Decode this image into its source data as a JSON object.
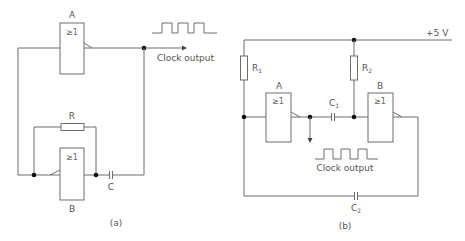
{
  "diagram_a": {
    "caption": "(a)",
    "gate_a": {
      "name": "A",
      "symbol": "≥1"
    },
    "gate_b": {
      "name": "B",
      "symbol": "≥1"
    },
    "resistor": {
      "label": "R"
    },
    "capacitor": {
      "label": "C"
    },
    "output_label": "Clock output"
  },
  "diagram_b": {
    "caption": "(b)",
    "supply_label": "+5 V",
    "gate_a": {
      "name": "A",
      "symbol": "≥1"
    },
    "gate_b": {
      "name": "B",
      "symbol": "≥1"
    },
    "r1": {
      "label": "R",
      "sub": "1"
    },
    "r2": {
      "label": "R",
      "sub": "2"
    },
    "c1": {
      "label": "C",
      "sub": "1"
    },
    "c2": {
      "label": "C",
      "sub": "2"
    },
    "output_label": "Clock output"
  },
  "colors": {
    "wire": "#6d6d6d",
    "node": "#111111",
    "text": "#555555"
  }
}
